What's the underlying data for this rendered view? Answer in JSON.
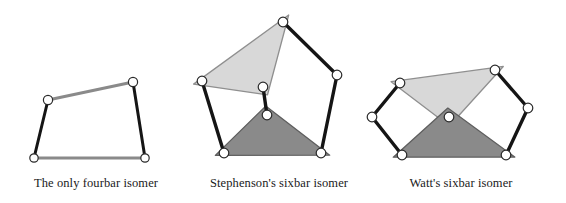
{
  "figure": {
    "title_visible": false,
    "background_color": "#ffffff",
    "colors": {
      "light_link_fill": "#d8d8d8",
      "light_link_stroke": "#8f8f8f",
      "dark_link_fill": "#8a8a8a",
      "dark_link_stroke": "#5e5e5e",
      "binary_link_black": "#151515",
      "binary_link_gray": "#8a8a8a",
      "joint_fill": "#ffffff",
      "joint_stroke": "#2a2a2a",
      "caption_text": "#1a1a1a"
    },
    "panels": [
      {
        "id": "fourbar",
        "caption": "The only fourbar isomer",
        "caption_x": 96,
        "links": [
          {
            "name": "ground-link",
            "type": "binary",
            "color": "gray",
            "from": [
              34,
              158
            ],
            "to": [
              145,
              158
            ],
            "width": 3
          },
          {
            "name": "left-crank",
            "type": "binary",
            "color": "black",
            "from": [
              34,
              158
            ],
            "to": [
              48,
              100
            ],
            "width": 3
          },
          {
            "name": "coupler-link",
            "type": "binary",
            "color": "gray",
            "from": [
              48,
              100
            ],
            "to": [
              133,
              82
            ],
            "width": 3
          },
          {
            "name": "right-rocker",
            "type": "binary",
            "color": "black",
            "from": [
              133,
              82
            ],
            "to": [
              145,
              158
            ],
            "width": 3
          }
        ],
        "joints": [
          {
            "name": "joint-bottom-left",
            "cx": 34,
            "cy": 158,
            "r": 4.2
          },
          {
            "name": "joint-bottom-right",
            "cx": 145,
            "cy": 158,
            "r": 4.2
          },
          {
            "name": "joint-top-left",
            "cx": 48,
            "cy": 100,
            "r": 4.6
          },
          {
            "name": "joint-top-right",
            "cx": 133,
            "cy": 82,
            "r": 4.6
          }
        ]
      },
      {
        "id": "stephenson",
        "caption": "Stephenson's sixbar isomer",
        "caption_x": 279,
        "ternary_links": [
          {
            "name": "light-ternary-link",
            "shade": "light",
            "vertices": [
              [
                202,
                81
              ],
              [
                283,
                22
              ],
              [
                263,
                87
              ]
            ]
          },
          {
            "name": "dark-ternary-ground-link",
            "shade": "dark",
            "vertices": [
              [
                224,
                153
              ],
              [
                267,
                115
              ],
              [
                321,
                153
              ]
            ]
          }
        ],
        "links": [
          {
            "name": "left-binary-link",
            "type": "binary",
            "color": "black",
            "from": [
              202,
              81
            ],
            "to": [
              224,
              153
            ],
            "width": 3.4
          },
          {
            "name": "center-binary-link",
            "type": "binary",
            "color": "black",
            "from": [
              263,
              87
            ],
            "to": [
              267,
              115
            ],
            "width": 3.4
          },
          {
            "name": "upper-right-binary-link",
            "type": "binary",
            "color": "black",
            "from": [
              283,
              22
            ],
            "to": [
              337,
              75
            ],
            "width": 3.4
          },
          {
            "name": "lower-right-binary-link",
            "type": "binary",
            "color": "black",
            "from": [
              337,
              75
            ],
            "to": [
              321,
              153
            ],
            "width": 3.4
          }
        ],
        "joints": [
          {
            "name": "joint-light-left",
            "cx": 202,
            "cy": 81,
            "r": 4.8
          },
          {
            "name": "joint-light-apex",
            "cx": 283,
            "cy": 22,
            "r": 4.8
          },
          {
            "name": "joint-light-lower",
            "cx": 263,
            "cy": 87,
            "r": 4.8
          },
          {
            "name": "joint-dark-apex",
            "cx": 267,
            "cy": 115,
            "r": 4.8
          },
          {
            "name": "joint-dark-left",
            "cx": 224,
            "cy": 153,
            "r": 4.8
          },
          {
            "name": "joint-dark-right",
            "cx": 321,
            "cy": 153,
            "r": 4.8
          },
          {
            "name": "joint-right-elbow",
            "cx": 337,
            "cy": 75,
            "r": 4.8
          }
        ]
      },
      {
        "id": "watt",
        "caption": "Watt's sixbar isomer",
        "caption_x": 461,
        "ternary_links": [
          {
            "name": "light-ternary-link",
            "shade": "light",
            "vertices": [
              [
                400,
                83
              ],
              [
                495,
                70
              ],
              [
                449,
                117
              ]
            ]
          },
          {
            "name": "dark-ternary-ground-link",
            "shade": "dark",
            "vertices": [
              [
                402,
                155
              ],
              [
                449,
                117
              ],
              [
                506,
                155
              ]
            ]
          }
        ],
        "links": [
          {
            "name": "left-upper-binary-link",
            "type": "binary",
            "color": "black",
            "from": [
              400,
              83
            ],
            "to": [
              372,
              117
            ],
            "width": 3.4
          },
          {
            "name": "left-lower-binary-link",
            "type": "binary",
            "color": "black",
            "from": [
              372,
              117
            ],
            "to": [
              402,
              155
            ],
            "width": 3.4
          },
          {
            "name": "right-upper-binary-link",
            "type": "binary",
            "color": "black",
            "from": [
              495,
              70
            ],
            "to": [
              528,
              108
            ],
            "width": 3.4
          },
          {
            "name": "right-lower-binary-link",
            "type": "binary",
            "color": "black",
            "from": [
              528,
              108
            ],
            "to": [
              506,
              155
            ],
            "width": 3.4
          }
        ],
        "joints": [
          {
            "name": "joint-light-left",
            "cx": 400,
            "cy": 83,
            "r": 4.8
          },
          {
            "name": "joint-light-right",
            "cx": 495,
            "cy": 70,
            "r": 4.8
          },
          {
            "name": "joint-center",
            "cx": 449,
            "cy": 117,
            "r": 4.8
          },
          {
            "name": "joint-left-outer",
            "cx": 372,
            "cy": 117,
            "r": 4.8
          },
          {
            "name": "joint-right-outer",
            "cx": 528,
            "cy": 108,
            "r": 4.8
          },
          {
            "name": "joint-dark-left",
            "cx": 402,
            "cy": 155,
            "r": 4.8
          },
          {
            "name": "joint-dark-right",
            "cx": 506,
            "cy": 155,
            "r": 4.8
          }
        ]
      }
    ]
  }
}
